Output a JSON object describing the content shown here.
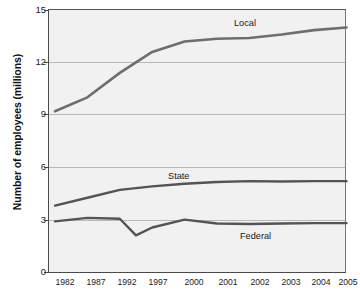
{
  "chart_data": {
    "type": "line",
    "title": "",
    "xlabel": "",
    "ylabel": "Number of employees (millions)",
    "categories": [
      "1982",
      "1987",
      "1992",
      "1997",
      "2000",
      "2001",
      "2002",
      "2003",
      "2004",
      "2005"
    ],
    "x_tick_labels": [
      "1982",
      "1987",
      "1992",
      "1997",
      "2000",
      "2001",
      "2002",
      "2003",
      "2004",
      "2005"
    ],
    "y_tick_labels": [
      "0",
      "3",
      "6",
      "9",
      "12",
      "15"
    ],
    "y_ticks": [
      0,
      3,
      6,
      9,
      12,
      15
    ],
    "ylim": [
      0,
      15
    ],
    "grid": "horizontal",
    "gridlines_at": [
      3,
      6,
      9,
      12
    ],
    "legend_position": "inline-labels",
    "series": [
      {
        "name": "Local",
        "color": "#6e6e6e",
        "label_text": "Local",
        "values": [
          9.2,
          10.0,
          11.4,
          12.6,
          13.2,
          13.35,
          13.4,
          13.6,
          13.85,
          14.0
        ]
      },
      {
        "name": "State",
        "color": "#545454",
        "label_text": "State",
        "values": [
          3.8,
          4.25,
          4.7,
          4.9,
          5.05,
          5.15,
          5.2,
          5.18,
          5.2,
          5.2
        ]
      },
      {
        "name": "Federal",
        "color": "#545454",
        "label_text": "Federal",
        "values": [
          2.9,
          3.1,
          3.05,
          2.55,
          3.0,
          2.78,
          2.75,
          2.78,
          2.8,
          2.8
        ],
        "note": "dips to about 2.1 between 1992 and 1997"
      }
    ],
    "federal_dip": {
      "min_value": 2.1,
      "between": [
        "1992",
        "1997"
      ]
    }
  },
  "colors": {
    "plot_background": "#f1f1f1",
    "page_background": "#ffffff",
    "axis": "#4a4a4a",
    "gridline": "#b9b9b9",
    "line_local": "#6e6e6e",
    "line_state": "#545454",
    "line_federal": "#545454",
    "text": "#1a1a1a"
  }
}
